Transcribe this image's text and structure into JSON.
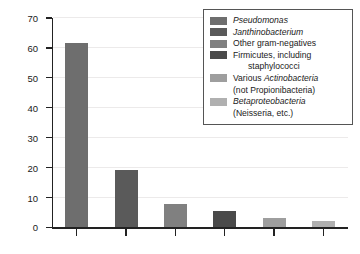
{
  "chart_data": {
    "type": "bar",
    "title": "",
    "xlabel": "",
    "ylabel": "Relative abundance",
    "ylim": [
      0,
      70
    ],
    "ytick_labels": [
      "0",
      "10",
      "20",
      "30",
      "40",
      "50",
      "60",
      "70"
    ],
    "ytick_values": [
      0,
      10,
      20,
      30,
      40,
      50,
      60,
      70
    ],
    "grid": true,
    "grid_axis": "y",
    "legend_position": "top-right",
    "x_tick_count": 6,
    "x_tick_labels": [
      "",
      "",
      "",
      "",
      "",
      ""
    ],
    "categories": [
      "Pseudomonas",
      "Janthinobacterium",
      "Other gram-negatives",
      "Firmicutes, including staphylococci",
      "Various Actinobacteria (not Propionibacteria)",
      "Betaproteobacteria (Neisseria, etc.)"
    ],
    "values": [
      61.8,
      19.3,
      7.8,
      5.5,
      3.3,
      2.2
    ],
    "colors": [
      "#6e6e6e",
      "#5a5a5a",
      "#808080",
      "#4a4a4a",
      "#9e9e9e",
      "#b0b0b0"
    ]
  },
  "legend": {
    "entries": [
      {
        "swatch_color": "#6e6e6e",
        "line1_pre": "",
        "line1_italic": "Pseudomonas",
        "line1_post": "",
        "line2": ""
      },
      {
        "swatch_color": "#5a5a5a",
        "line1_pre": "",
        "line1_italic": "Janthinobacterium",
        "line1_post": "",
        "line2": ""
      },
      {
        "swatch_color": "#808080",
        "line1_pre": "Other gram-negatives",
        "line1_italic": "",
        "line1_post": "",
        "line2": ""
      },
      {
        "swatch_color": "#4a4a4a",
        "line1_pre": "Firmicutes, including",
        "line1_italic": "",
        "line1_post": "",
        "line2": "staphylococci"
      },
      {
        "swatch_color": "#9e9e9e",
        "line1_pre": "Various ",
        "line1_italic": "Actinobacteria",
        "line1_post": "",
        "line2_pre": "(not ",
        "line2_italic": "Propionibacteria",
        "line2_post": ")"
      },
      {
        "swatch_color": "#b0b0b0",
        "line1_pre": "",
        "line1_italic": "Betaproteobacteria",
        "line1_post": "",
        "line2_pre": "(",
        "line2_italic": "Neisseria",
        "line2_post": ", etc.)"
      }
    ]
  },
  "axes": {
    "y_title": "Relative abundance"
  }
}
